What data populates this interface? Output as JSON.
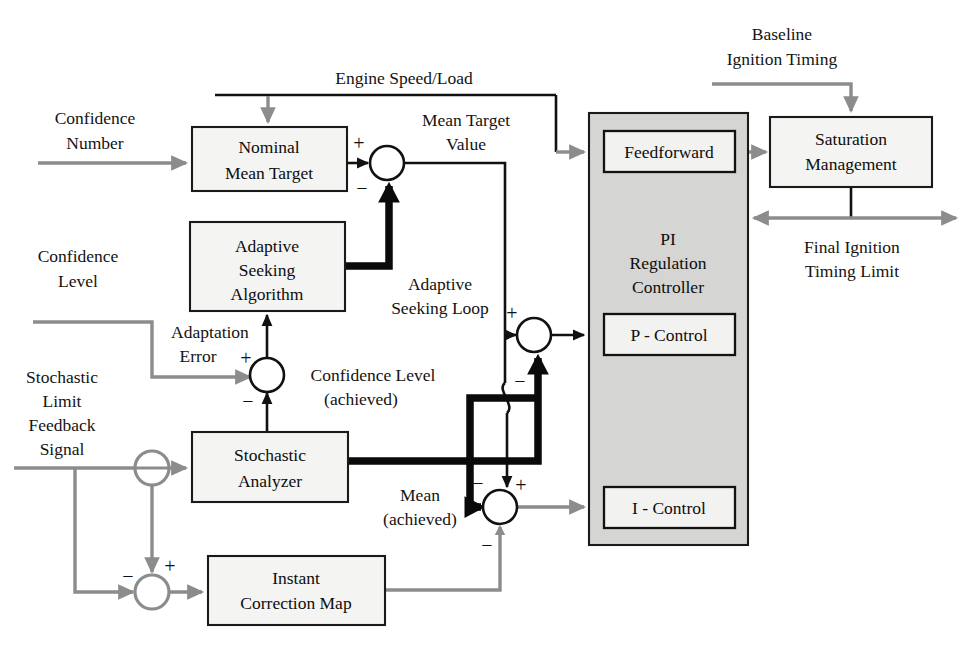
{
  "diagram": {
    "colors": {
      "gray_signal": "#8c8c8c",
      "black_signal": "#111111",
      "controller_fill": "#d5d5d3",
      "block_fill": "#f4f4f2"
    },
    "blocks": [
      {
        "id": "nominal_mean_target",
        "lines": [
          "Nominal",
          "Mean Target"
        ]
      },
      {
        "id": "adaptive_seeking_algorithm",
        "lines": [
          "Adaptive",
          "Seeking",
          "Algorithm"
        ]
      },
      {
        "id": "stochastic_analyzer",
        "lines": [
          "Stochastic",
          "Analyzer"
        ]
      },
      {
        "id": "instant_correction_map",
        "lines": [
          "Instant",
          "Correction Map"
        ]
      },
      {
        "id": "pi_regulation_controller",
        "lines": [
          "PI",
          "Regulation",
          "Controller"
        ]
      },
      {
        "id": "feedforward",
        "lines": [
          "Feedforward"
        ]
      },
      {
        "id": "p_control",
        "lines": [
          "P - Control"
        ]
      },
      {
        "id": "i_control",
        "lines": [
          "I - Control"
        ]
      },
      {
        "id": "saturation_management",
        "lines": [
          "Saturation",
          "Management"
        ]
      }
    ],
    "signal_labels": [
      {
        "id": "confidence_number",
        "lines": [
          "Confidence",
          "Number"
        ]
      },
      {
        "id": "engine_speed_load",
        "lines": [
          "Engine Speed/Load"
        ]
      },
      {
        "id": "mean_target_value",
        "lines": [
          "Mean Target",
          "Value"
        ]
      },
      {
        "id": "baseline_ignition_timing",
        "lines": [
          "Baseline",
          "Ignition Timing"
        ]
      },
      {
        "id": "final_ignition_timing_limit",
        "lines": [
          "Final Ignition",
          "Timing Limit"
        ]
      },
      {
        "id": "adaptive_seeking_loop",
        "lines": [
          "Adaptive",
          "Seeking Loop"
        ]
      },
      {
        "id": "confidence_level",
        "lines": [
          "Confidence",
          "Level"
        ]
      },
      {
        "id": "adaptation_error",
        "lines": [
          "Adaptation",
          "Error"
        ]
      },
      {
        "id": "confidence_level_achieved",
        "lines": [
          "Confidence Level",
          "(achieved)"
        ]
      },
      {
        "id": "stochastic_limit_feedback_signal",
        "lines": [
          "Stochastic",
          "Limit",
          "Feedback",
          "Signal"
        ]
      },
      {
        "id": "mean_achieved",
        "lines": [
          "Mean",
          "(achieved)"
        ]
      }
    ],
    "text": {
      "nominal_1": "Nominal",
      "nominal_2": "Mean Target",
      "adaptive_1": "Adaptive",
      "adaptive_2": "Seeking",
      "adaptive_3": "Algorithm",
      "stoch_1": "Stochastic",
      "stoch_2": "Analyzer",
      "instant_1": "Instant",
      "instant_2": "Correction Map",
      "pi_1": "PI",
      "pi_2": "Regulation",
      "pi_3": "Controller",
      "feedforward": "Feedforward",
      "p_control": "P - Control",
      "i_control": "I - Control",
      "sat_1": "Saturation",
      "sat_2": "Management",
      "conf_num_1": "Confidence",
      "conf_num_2": "Number",
      "engine_speed_load": "Engine Speed/Load",
      "mtv_1": "Mean Target",
      "mtv_2": "Value",
      "bit_1": "Baseline",
      "bit_2": "Ignition Timing",
      "fitl_1": "Final Ignition",
      "fitl_2": "Timing Limit",
      "asl_1": "Adaptive",
      "asl_2": "Seeking Loop",
      "conf_lvl_1": "Confidence",
      "conf_lvl_2": "Level",
      "adapt_err_1": "Adaptation",
      "adapt_err_2": "Error",
      "cla_1": "Confidence Level",
      "cla_2": "(achieved)",
      "slfs_1": "Stochastic",
      "slfs_2": "Limit",
      "slfs_3": "Feedback",
      "slfs_4": "Signal",
      "mean_ach_1": "Mean",
      "mean_ach_2": "(achieved)",
      "plus": "+",
      "minus": "−"
    },
    "summing_junctions": [
      {
        "id": "mean-target-junction",
        "plus": "+",
        "minus": "−"
      },
      {
        "id": "confidence-level-junction",
        "plus": "+",
        "minus": "−"
      },
      {
        "id": "p-control-junction",
        "plus": "+",
        "minus": "−"
      },
      {
        "id": "i-control-junction",
        "plus": "+",
        "minus": "−"
      },
      {
        "id": "instant-correction-junction",
        "plus": "+",
        "minus": "−"
      },
      {
        "id": "feedback-split-junction",
        "plus": "",
        "minus": ""
      }
    ]
  }
}
